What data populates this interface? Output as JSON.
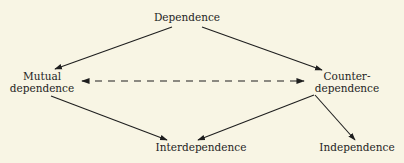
{
  "diagram": {
    "background": "#f8f5e4",
    "line_color": "#1e1e1e",
    "nodes": {
      "dependence": {
        "label": "Dependence"
      },
      "mutual": {
        "line1": "Mutual",
        "line2": "dependence"
      },
      "counter": {
        "line1": "Counter-",
        "line2": "dependence"
      },
      "interdependence": {
        "label": "Interdependence"
      },
      "independence": {
        "label": "Independence"
      }
    },
    "edges": [
      {
        "from": "Dependence",
        "to": "Mutual dependence",
        "style": "solid",
        "arrow": "end"
      },
      {
        "from": "Dependence",
        "to": "Counter-dependence",
        "style": "solid",
        "arrow": "end"
      },
      {
        "from": "Mutual dependence",
        "to": "Counter-dependence",
        "style": "dashed",
        "arrow": "both"
      },
      {
        "from": "Mutual dependence",
        "to": "Interdependence",
        "style": "solid",
        "arrow": "end"
      },
      {
        "from": "Counter-dependence",
        "to": "Interdependence",
        "style": "solid",
        "arrow": "end"
      },
      {
        "from": "Counter-dependence",
        "to": "Independence",
        "style": "solid",
        "arrow": "end"
      }
    ]
  }
}
